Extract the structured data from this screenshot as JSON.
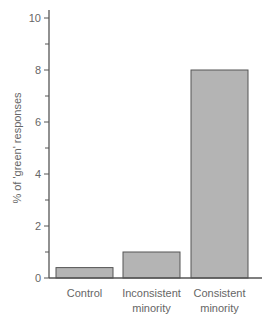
{
  "chart_data": {
    "type": "bar",
    "title": "",
    "xlabel": "",
    "ylabel": "% of 'green' responses",
    "categories": [
      "Control",
      "Inconsistent minority",
      "Consistent minority"
    ],
    "category_lines": [
      [
        "Control"
      ],
      [
        "Inconsistent",
        "minority"
      ],
      [
        "Consistent",
        "minority"
      ]
    ],
    "values": [
      0.4,
      1.0,
      8.0
    ],
    "ylim": [
      0,
      10
    ],
    "major_ticks": [
      0,
      2,
      4,
      6,
      8,
      10
    ],
    "minor_ticks": [
      1,
      3,
      5,
      7,
      9
    ],
    "grid": false,
    "legend": null,
    "colors": {
      "bar_fill": "#b4b4b4",
      "bar_stroke": "#555555",
      "axis": "#555555",
      "text": "#666666"
    }
  }
}
